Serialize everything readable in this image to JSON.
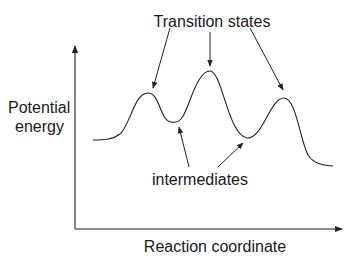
{
  "diagram": {
    "type": "energy-profile",
    "y_axis_label_line1": "Potential",
    "y_axis_label_line2": "energy",
    "x_axis_label": "Reaction coordinate",
    "top_annotation": "Transition states",
    "bottom_annotation": "intermediates",
    "line_color": "#222222",
    "curve_points": [
      {
        "role": "start",
        "x": 93,
        "y": 140
      },
      {
        "role": "transition-state-1",
        "x": 148,
        "y": 93
      },
      {
        "role": "intermediate-1",
        "x": 173,
        "y": 122
      },
      {
        "role": "transition-state-2",
        "x": 210,
        "y": 71
      },
      {
        "role": "intermediate-2",
        "x": 248,
        "y": 138
      },
      {
        "role": "transition-state-3",
        "x": 284,
        "y": 98
      },
      {
        "role": "end",
        "x": 333,
        "y": 166
      }
    ]
  }
}
